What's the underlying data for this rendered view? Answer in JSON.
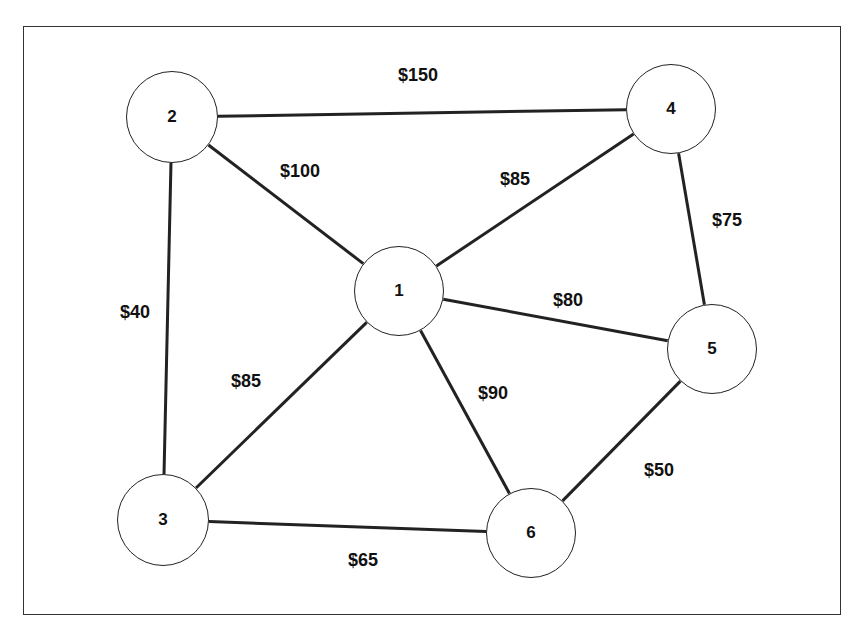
{
  "diagram": {
    "type": "weighted-network-graph",
    "nodes": [
      {
        "id": "1",
        "label": "1",
        "x": 399,
        "y": 291,
        "r": 45
      },
      {
        "id": "2",
        "label": "2",
        "x": 172,
        "y": 117,
        "r": 46
      },
      {
        "id": "3",
        "label": "3",
        "x": 163,
        "y": 520,
        "r": 46
      },
      {
        "id": "4",
        "label": "4",
        "x": 671,
        "y": 109,
        "r": 45
      },
      {
        "id": "5",
        "label": "5",
        "x": 712,
        "y": 349,
        "r": 45
      },
      {
        "id": "6",
        "label": "6",
        "x": 531,
        "y": 533,
        "r": 45
      }
    ],
    "edges": [
      {
        "from": "2",
        "to": "4",
        "label": "$150",
        "lx": 418,
        "ly": 75
      },
      {
        "from": "2",
        "to": "1",
        "label": "$100",
        "lx": 300,
        "ly": 171
      },
      {
        "from": "2",
        "to": "3",
        "label": "$40",
        "lx": 135,
        "ly": 312
      },
      {
        "from": "1",
        "to": "4",
        "label": "$85",
        "lx": 515,
        "ly": 179
      },
      {
        "from": "4",
        "to": "5",
        "label": "$75",
        "lx": 727,
        "ly": 220
      },
      {
        "from": "1",
        "to": "5",
        "label": "$80",
        "lx": 568,
        "ly": 300
      },
      {
        "from": "1",
        "to": "3",
        "label": "$85",
        "lx": 246,
        "ly": 381
      },
      {
        "from": "1",
        "to": "6",
        "label": "$90",
        "lx": 493,
        "ly": 393
      },
      {
        "from": "5",
        "to": "6",
        "label": "$50",
        "lx": 659,
        "ly": 470
      },
      {
        "from": "3",
        "to": "6",
        "label": "$65",
        "lx": 363,
        "ly": 560
      }
    ]
  },
  "colors": {
    "stroke": "#222222",
    "text": "#111111",
    "background": "#ffffff"
  }
}
